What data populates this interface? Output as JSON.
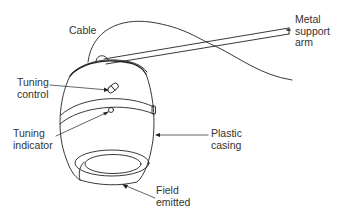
{
  "diagram": {
    "labels": {
      "cable": "Cable",
      "metal_support_arm": "Metal\nsupport\narm",
      "tuning_control": "Tuning\ncontrol",
      "tuning_indicator": "Tuning\nindicator",
      "plastic_casing": "Plastic\ncasing",
      "field_emitted": "Field\nemitted"
    },
    "caption_partial": "",
    "colors": {
      "line": "#222222",
      "text": "#333333",
      "background": "#ffffff"
    }
  }
}
